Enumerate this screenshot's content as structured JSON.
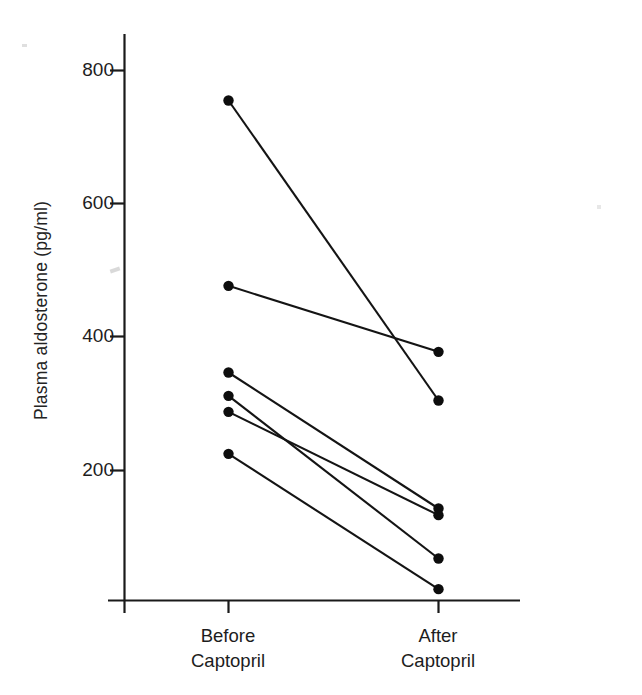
{
  "chart_data": {
    "type": "line",
    "title": "",
    "subtitle": "",
    "xlabel": "",
    "ylabel": "Plasma aldosterone (pg/ml)",
    "categories": [
      "Before Captopril",
      "After Captopril"
    ],
    "x_tick_labels": [
      {
        "line1": "Before",
        "line2": "Captopril"
      },
      {
        "line1": "After",
        "line2": "Captopril"
      }
    ],
    "y_tick_labels": [
      "800",
      "600",
      "400",
      "200"
    ],
    "y_ticks": [
      800,
      600,
      400,
      200
    ],
    "ylim": [
      0,
      860
    ],
    "xlim": [
      0,
      1
    ],
    "grid": false,
    "legend": false,
    "legend_position": "none",
    "marker": "filled-circle",
    "annotations": [],
    "series": [
      {
        "name": "subject-1",
        "values": [
          755,
          305
        ]
      },
      {
        "name": "subject-2",
        "values": [
          477,
          378
        ]
      },
      {
        "name": "subject-3",
        "values": [
          347,
          143
        ]
      },
      {
        "name": "subject-4",
        "values": [
          312,
          68
        ]
      },
      {
        "name": "subject-5",
        "values": [
          288,
          133
        ]
      },
      {
        "name": "subject-6",
        "values": [
          225,
          22
        ]
      }
    ]
  },
  "axes": {
    "y_axis_label": "Plasma aldosterone (pg/ml)",
    "x_axis_label": ""
  }
}
